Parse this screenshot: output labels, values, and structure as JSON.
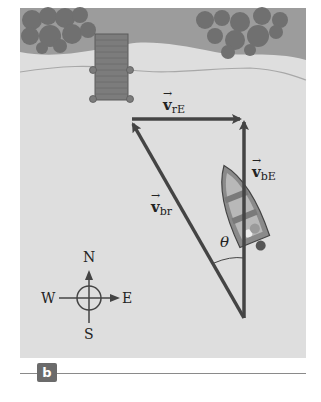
{
  "figure": {
    "panel_label": "b",
    "vectors": {
      "v_rE": {
        "symbol": "v",
        "subscript": "rE"
      },
      "v_bE": {
        "symbol": "v",
        "subscript": "bE"
      },
      "v_br": {
        "symbol": "v",
        "subscript": "br"
      }
    },
    "angle_label": "θ",
    "compass": {
      "north": "N",
      "south": "S",
      "east": "E",
      "west": "W"
    },
    "colors": {
      "land": "#9a9a9a",
      "water": "#dedede",
      "trees": "#6e6e6e",
      "dock": "#7a7a7a",
      "vector": "#444444",
      "background": "#ffffff"
    }
  }
}
